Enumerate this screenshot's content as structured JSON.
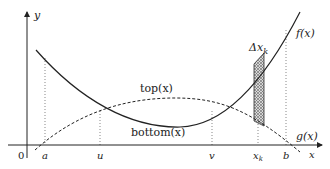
{
  "diagram": {
    "type": "area-between-curves",
    "axes": {
      "x_label": "x",
      "y_label": "y",
      "origin_label": "0"
    },
    "curves": [
      {
        "id": "f",
        "label": "f(x)",
        "style": "solid",
        "role": "top-at-ends"
      },
      {
        "id": "g",
        "label": "g(x)",
        "style": "dashed",
        "role": "bottom-at-ends"
      }
    ],
    "region_labels": {
      "top": "top(x)",
      "bottom": "bottom(x)"
    },
    "x_ticks": [
      "a",
      "u",
      "v",
      "x",
      "b"
    ],
    "x_tick_subscripts": {
      "x": "k"
    },
    "strip": {
      "label": "Δx",
      "label_subscript": "k",
      "pattern": "crosshatch"
    }
  }
}
